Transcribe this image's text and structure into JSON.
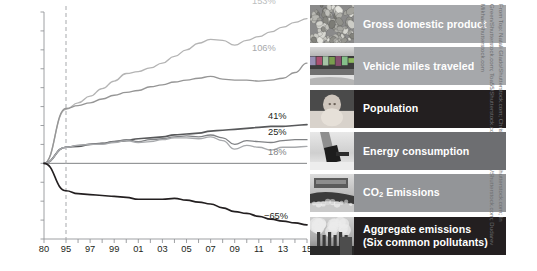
{
  "chart_data": {
    "type": "line",
    "title": "",
    "xlabel": "",
    "ylabel": "",
    "ylim": [
      -80,
      160
    ],
    "yticks": [
      "160%",
      "140%",
      "120%",
      "100%",
      "80%",
      "60%",
      "40%",
      "20%",
      "0%",
      "−20%",
      "−40%",
      "−60%",
      "−80%"
    ],
    "ytick_values": [
      160,
      140,
      120,
      100,
      80,
      60,
      40,
      20,
      0,
      -20,
      -40,
      -60,
      -80
    ],
    "xticks": [
      "80",
      "95",
      "97",
      "99",
      "01",
      "03",
      "05",
      "07",
      "09",
      "11",
      "13",
      "15"
    ],
    "xtick_values": [
      1980,
      1995,
      1997,
      1999,
      2001,
      2003,
      2005,
      2007,
      2009,
      2011,
      2013,
      2015
    ],
    "grid": false,
    "legend_position": "right",
    "reference_line_year": 1995,
    "zero_line": true,
    "x": [
      1980,
      1995,
      1996,
      1997,
      1998,
      1999,
      2000,
      2001,
      2002,
      2003,
      2004,
      2005,
      2006,
      2007,
      2008,
      2009,
      2010,
      2011,
      2012,
      2013,
      2014,
      2015
    ],
    "series": [
      {
        "name": "Gross domestic product",
        "color": "#b4b4b4",
        "end_label": "153%",
        "end_value": 153,
        "values": [
          0,
          57,
          64,
          71,
          79,
          87,
          95,
          97,
          101,
          106,
          113,
          120,
          127,
          131,
          130,
          125,
          130,
          134,
          139,
          144,
          149,
          153
        ]
      },
      {
        "name": "Vehicle miles traveled",
        "color": "#969696",
        "end_label": "106%",
        "end_value": 106,
        "values": [
          0,
          58,
          61,
          64,
          68,
          72,
          75,
          77,
          81,
          83,
          86,
          88,
          90,
          92,
          89,
          88,
          88,
          87,
          88,
          90,
          96,
          106
        ]
      },
      {
        "name": "Population",
        "color": "#58595b",
        "end_label": "41%",
        "end_value": 41,
        "values": [
          0,
          17,
          18,
          20,
          21,
          23,
          24,
          26,
          27,
          28,
          30,
          31,
          32,
          34,
          35,
          36,
          37,
          38,
          39,
          39,
          40,
          41
        ]
      },
      {
        "name": "Energy consumption",
        "color": "#808285",
        "end_label": "25%",
        "end_value": 25,
        "values": [
          0,
          17,
          19,
          20,
          21,
          23,
          25,
          23,
          25,
          26,
          28,
          29,
          28,
          30,
          27,
          20,
          24,
          23,
          22,
          24,
          25,
          25
        ]
      },
      {
        "name": "CO₂ Emissions",
        "color": "#a7a9ac",
        "end_label": "18%",
        "end_value": 18,
        "values": [
          0,
          17,
          19,
          20,
          20,
          22,
          24,
          22,
          23,
          25,
          27,
          27,
          26,
          28,
          24,
          15,
          19,
          17,
          14,
          17,
          17,
          18
        ]
      },
      {
        "name": "Aggregate emissions (Six common pollutants)",
        "color": "#231f20",
        "end_label": "−65%",
        "end_value": -65,
        "values": [
          0,
          -29,
          -32,
          -33,
          -34,
          -35,
          -36,
          -38,
          -38,
          -38,
          -37,
          -39,
          -41,
          -43,
          -47,
          -51,
          -53,
          -56,
          -59,
          -61,
          -63,
          -65
        ]
      }
    ]
  },
  "legend": {
    "items": [
      {
        "label": "Gross domestic product",
        "band_color": "#a6a8ab",
        "thumb": "gravel-coins-photo"
      },
      {
        "label": "Vehicle miles traveled",
        "band_color": "#a6a8ab",
        "thumb": "traffic-cars-photo"
      },
      {
        "label": "Population",
        "band_color": "#231f20",
        "thumb": "baby-photo"
      },
      {
        "label": "Energy consumption",
        "band_color": "#6d6e71",
        "thumb": "electric-plug-photo"
      },
      {
        "label": "CO",
        "label_sub": "2",
        "label_tail": " Emissions",
        "band_color": "#939598",
        "thumb": "car-exhaust-photo"
      },
      {
        "label": "Aggregate emissions",
        "label_line2": "(Six common pollutants)",
        "band_color": "#231f20",
        "thumb": "smokestacks-photo"
      }
    ]
  },
  "credit": {
    "text": "From Top: Natali Glado/Shutterstock.com; Christian Mueller/Shutterstock.com; In Green/Shutterstock.com; Toa55/Shutterstock.com; Arthimides/Shutterstock.com; Dudarev Mikhail/Shutterstock.com"
  }
}
